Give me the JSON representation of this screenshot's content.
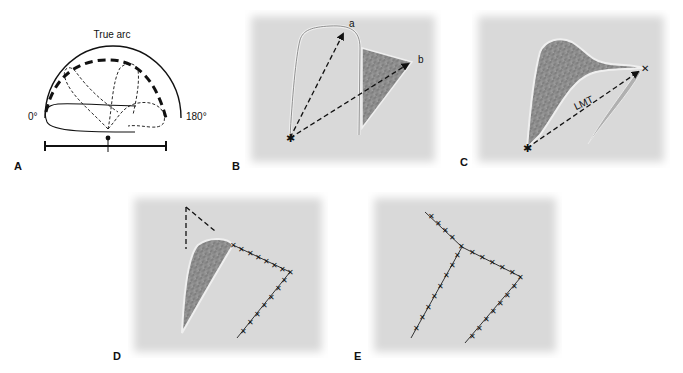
{
  "figure": {
    "panels": [
      {
        "id": "A",
        "letter": "A",
        "description": "Arc of rotation schematic"
      },
      {
        "id": "B",
        "letter": "B",
        "description": "Flap design with pivot point and vectors a, b"
      },
      {
        "id": "C",
        "letter": "C",
        "description": "Flap rotated, showing LMT (line of maximal tension)"
      },
      {
        "id": "D",
        "letter": "D",
        "description": "Partial closure with sutures and standing cone"
      },
      {
        "id": "E",
        "letter": "E",
        "description": "Final sutured closure"
      }
    ],
    "panelA": {
      "arc_label": "True arc",
      "left_angle": "0°",
      "right_angle": "180°"
    },
    "panelB": {
      "label_a": "a",
      "label_b": "b"
    },
    "panelC": {
      "label_lmt": "LMT"
    }
  },
  "colors": {
    "panel_background": "#d9d9d9",
    "line": "#111111",
    "flap_fill": "#8a8a8a",
    "flap_edge": "#efefef"
  }
}
